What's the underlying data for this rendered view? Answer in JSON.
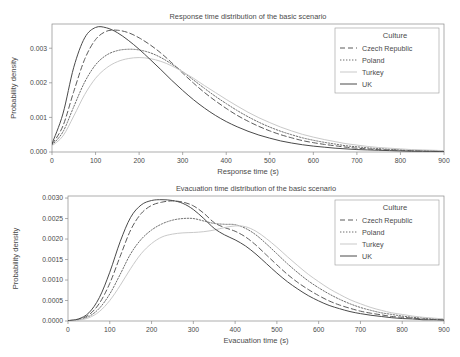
{
  "figure": {
    "background": "#ffffff",
    "width": 460,
    "height": 357
  },
  "legend": {
    "title": "Culture",
    "position": "upper-right-inside",
    "entries": [
      {
        "label": "Czech Republic",
        "style": "dashed",
        "color": "#5a5a5a",
        "dash": "5,3"
      },
      {
        "label": "Poland",
        "style": "dotted",
        "color": "#6e6e6e",
        "dash": "1.4,1.6"
      },
      {
        "label": "Turkey",
        "style": "solid",
        "color": "#c9c9c9",
        "dash": "none"
      },
      {
        "label": "UK",
        "style": "solid",
        "color": "#4a4a4a",
        "dash": "none"
      }
    ]
  },
  "chart_data": [
    {
      "type": "line",
      "title": "Response time distribution of the basic scenario",
      "xlabel": "Response time (s)",
      "ylabel": "Probability density",
      "xlim": [
        0,
        900
      ],
      "ylim": [
        0,
        0.0037
      ],
      "xticks": [
        0,
        100,
        200,
        300,
        400,
        500,
        600,
        700,
        800,
        900
      ],
      "yticks": [
        0.0,
        0.001,
        0.002,
        0.003
      ],
      "ytick_labels": [
        "0.000",
        "0.001",
        "0.002",
        "0.003"
      ],
      "grid": false,
      "x": [
        0,
        25,
        50,
        75,
        100,
        125,
        150,
        175,
        200,
        225,
        250,
        275,
        300,
        325,
        350,
        375,
        400,
        425,
        450,
        475,
        500,
        525,
        550,
        575,
        600,
        625,
        650,
        675,
        700,
        725,
        750,
        775,
        800,
        825,
        850,
        875,
        900
      ],
      "series": [
        {
          "name": "Czech Republic",
          "values": [
            0.00022,
            0.00075,
            0.00175,
            0.00268,
            0.00325,
            0.00349,
            0.00352,
            0.00345,
            0.0033,
            0.0031,
            0.00286,
            0.00258,
            0.00228,
            0.00199,
            0.00172,
            0.00148,
            0.00126,
            0.00106,
            0.00089,
            0.00074,
            0.00061,
            0.0005,
            0.00041,
            0.00033,
            0.00027,
            0.00022,
            0.00018,
            0.00014,
            0.00011,
            9e-05,
            7e-05,
            6e-05,
            5e-05,
            4e-05,
            3e-05,
            2e-05,
            2e-05
          ]
        },
        {
          "name": "Poland",
          "values": [
            0.0002,
            0.00058,
            0.00131,
            0.00202,
            0.00252,
            0.0028,
            0.00293,
            0.00297,
            0.00295,
            0.00287,
            0.00273,
            0.00254,
            0.00232,
            0.00208,
            0.00184,
            0.00161,
            0.0014,
            0.0012,
            0.00102,
            0.00086,
            0.00072,
            0.0006,
            0.0005,
            0.00041,
            0.00034,
            0.00028,
            0.00023,
            0.00018,
            0.00015,
            0.00012,
            0.0001,
            8e-05,
            6e-05,
            5e-05,
            4e-05,
            3e-05,
            3e-05
          ]
        },
        {
          "name": "Turkey",
          "values": [
            0.00018,
            0.00046,
            0.00104,
            0.00166,
            0.00213,
            0.00243,
            0.00261,
            0.0027,
            0.00273,
            0.0027,
            0.00262,
            0.00249,
            0.00232,
            0.00213,
            0.00192,
            0.00172,
            0.00152,
            0.00133,
            0.00115,
            0.00099,
            0.00085,
            0.00072,
            0.00061,
            0.00051,
            0.00043,
            0.00036,
            0.0003,
            0.00024,
            0.0002,
            0.00016,
            0.00013,
            0.00011,
            9e-05,
            7e-05,
            6e-05,
            5e-05,
            4e-05
          ]
        },
        {
          "name": "UK",
          "values": [
            0.00024,
            0.0011,
            0.00245,
            0.0033,
            0.0036,
            0.00359,
            0.00345,
            0.00323,
            0.00297,
            0.00268,
            0.00238,
            0.00207,
            0.00178,
            0.00151,
            0.00127,
            0.00106,
            0.00088,
            0.00073,
            0.0006,
            0.00049,
            0.0004,
            0.00032,
            0.00026,
            0.00021,
            0.00017,
            0.00014,
            0.00011,
            9e-05,
            7e-05,
            6e-05,
            5e-05,
            4e-05,
            3e-05,
            2e-05,
            2e-05,
            2e-05,
            1e-05
          ]
        }
      ]
    },
    {
      "type": "line",
      "title": "Evacuation time distribution of the basic scenario",
      "xlabel": "Evacuation time (s)",
      "ylabel": "Probability density",
      "xlim": [
        0,
        900
      ],
      "ylim": [
        0,
        0.00305
      ],
      "xticks": [
        0,
        100,
        200,
        300,
        400,
        500,
        600,
        700,
        800,
        900
      ],
      "yticks": [
        0.0,
        0.0005,
        0.001,
        0.0015,
        0.002,
        0.0025,
        0.003
      ],
      "ytick_labels": [
        "0.0000",
        "0.0005",
        "0.0010",
        "0.0015",
        "0.0020",
        "0.0025",
        "0.0030"
      ],
      "grid": false,
      "x": [
        0,
        25,
        50,
        75,
        100,
        125,
        150,
        175,
        200,
        225,
        250,
        275,
        300,
        325,
        350,
        375,
        400,
        425,
        450,
        475,
        500,
        525,
        550,
        575,
        600,
        625,
        650,
        675,
        700,
        725,
        750,
        775,
        800,
        825,
        850,
        875,
        900
      ],
      "series": [
        {
          "name": "Czech Republic",
          "values": [
            1e-05,
            4e-05,
            0.00015,
            0.00043,
            0.00092,
            0.00158,
            0.00222,
            0.00262,
            0.00282,
            0.0029,
            0.00293,
            0.0029,
            0.00281,
            0.00263,
            0.0024,
            0.00228,
            0.00219,
            0.00205,
            0.00185,
            0.00161,
            0.00137,
            0.00114,
            0.00094,
            0.00077,
            0.00062,
            0.00049,
            0.00039,
            0.00031,
            0.00024,
            0.00019,
            0.00015,
            0.00011,
            9e-05,
            7e-05,
            5e-05,
            4e-05,
            3e-05
          ]
        },
        {
          "name": "Poland",
          "values": [
            1e-05,
            3e-05,
            0.00011,
            0.00031,
            0.00066,
            0.00114,
            0.00164,
            0.00199,
            0.00222,
            0.00237,
            0.00246,
            0.0025,
            0.0025,
            0.00244,
            0.00238,
            0.00236,
            0.00235,
            0.00226,
            0.0021,
            0.00188,
            0.00164,
            0.0014,
            0.00118,
            0.00098,
            0.00081,
            0.00066,
            0.00053,
            0.00042,
            0.00033,
            0.00026,
            0.0002,
            0.00016,
            0.00012,
            9e-05,
            7e-05,
            5e-05,
            4e-05
          ]
        },
        {
          "name": "Turkey",
          "values": [
            1e-05,
            2e-05,
            8e-05,
            0.00023,
            0.0005,
            0.00087,
            0.00128,
            0.00164,
            0.00189,
            0.00205,
            0.00212,
            0.00215,
            0.00216,
            0.00218,
            0.00222,
            0.00228,
            0.00232,
            0.0023,
            0.00219,
            0.00201,
            0.0018,
            0.00157,
            0.00135,
            0.00114,
            0.00096,
            0.00079,
            0.00065,
            0.00052,
            0.00042,
            0.00033,
            0.00026,
            0.0002,
            0.00016,
            0.00012,
            9e-05,
            7e-05,
            5e-05
          ]
        },
        {
          "name": "UK",
          "values": [
            1e-05,
            5e-05,
            0.0002,
            0.00057,
            0.00119,
            0.00194,
            0.00253,
            0.00283,
            0.00294,
            0.00296,
            0.00294,
            0.00287,
            0.00272,
            0.0025,
            0.00226,
            0.0021,
            0.00198,
            0.00183,
            0.00163,
            0.0014,
            0.00117,
            0.00096,
            0.00078,
            0.00062,
            0.00049,
            0.00038,
            0.0003,
            0.00023,
            0.00018,
            0.00014,
            0.00011,
            8e-05,
            6e-05,
            5e-05,
            3e-05,
            3e-05,
            2e-05
          ]
        }
      ]
    }
  ]
}
